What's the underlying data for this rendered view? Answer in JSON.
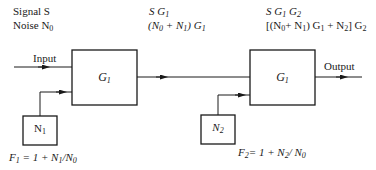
{
  "header": {
    "input_signal": "Signal S",
    "input_noise_prefix": "Noise N",
    "input_noise_sub": "0",
    "stage1_signal": {
      "S": "S G",
      "sub": "1"
    },
    "stage1_noise": {
      "a": "(N",
      "a_sub": "0",
      "b": " + N",
      "b_sub": "1",
      "c": ") G",
      "c_sub": "1"
    },
    "stage2_signal": {
      "a": "S G",
      "a_sub": "1",
      "b": " G",
      "b_sub": "2"
    },
    "stage2_noise": {
      "a": "[(N",
      "a_sub": "0",
      "b": "+ N",
      "b_sub": "1",
      "c": ") G",
      "c_sub": "1",
      "d": " + N",
      "d_sub": "2",
      "e": "] G",
      "e_sub": "2"
    }
  },
  "flow": {
    "input_label": "Input",
    "output_label": "Output"
  },
  "blocks": {
    "amp1": {
      "label": "G",
      "sub": "1"
    },
    "amp2": {
      "label": "G",
      "sub": "1"
    },
    "noise1": {
      "label": "N",
      "sub": "1"
    },
    "noise2": {
      "label": "N",
      "sub": "2"
    }
  },
  "formulas": {
    "f1": {
      "a": "F",
      "a_sub": "1",
      "b": " = 1 + N",
      "b_sub": "1",
      "c": "/N",
      "c_sub": "0"
    },
    "f2": {
      "a": "F",
      "a_sub": "2",
      "b": "= 1 + N",
      "b_sub": "2",
      "c": "/ N",
      "c_sub": "0"
    }
  },
  "colors": {
    "line": "#1a1a1a",
    "background": "#ffffff"
  }
}
